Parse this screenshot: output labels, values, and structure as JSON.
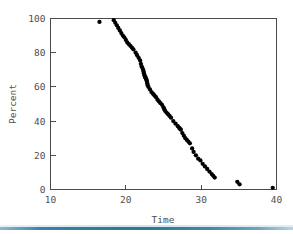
{
  "chart_data": {
    "type": "scatter",
    "title": "",
    "xlabel": "Time",
    "ylabel": "Percent",
    "xlim": [
      10,
      40
    ],
    "ylim": [
      0,
      100
    ],
    "xticks": [
      10,
      20,
      30,
      40
    ],
    "yticks": [
      0,
      20,
      40,
      60,
      80,
      100
    ],
    "xtick_labels": [
      "10",
      "20",
      "30",
      "40"
    ],
    "ytick_labels": [
      "0",
      "20",
      "40",
      "60",
      "80",
      "100"
    ],
    "grid": false,
    "legend": null,
    "marker": "filled-circle",
    "marker_color": "#000000",
    "series": [
      {
        "name": "Percent exceeding time",
        "x": [
          16.5,
          18.4,
          18.6,
          18.8,
          19.0,
          19.2,
          19.4,
          19.6,
          19.8,
          20.0,
          20.2,
          20.4,
          20.6,
          20.8,
          21.0,
          21.3,
          21.5,
          21.7,
          21.9,
          22.0,
          22.1,
          22.2,
          22.3,
          22.35,
          22.4,
          22.45,
          22.5,
          22.55,
          22.6,
          22.65,
          22.7,
          22.75,
          22.8,
          22.85,
          22.9,
          23.0,
          23.2,
          23.4,
          23.6,
          23.8,
          24.0,
          24.2,
          24.4,
          24.6,
          24.8,
          25.0,
          25.1,
          25.2,
          25.4,
          25.6,
          25.8,
          26.0,
          26.3,
          26.6,
          26.9,
          27.1,
          27.2,
          27.3,
          27.5,
          27.7,
          27.9,
          28.1,
          28.3,
          28.5,
          28.8,
          29.0,
          29.3,
          29.6,
          29.9,
          30.2,
          30.5,
          30.8,
          31.1,
          31.4,
          31.6,
          31.8,
          34.8,
          35.1,
          39.5
        ],
        "y": [
          98.0,
          99.0,
          97.5,
          96.0,
          94.5,
          93.0,
          91.5,
          90.0,
          89.0,
          87.5,
          86.0,
          85.0,
          84.0,
          83.0,
          82.0,
          80.0,
          78.5,
          77.0,
          75.5,
          73.5,
          72.0,
          71.0,
          70.0,
          69.0,
          68.0,
          67.0,
          66.5,
          66.0,
          65.5,
          65.0,
          64.5,
          64.0,
          63.0,
          62.0,
          61.0,
          60.0,
          58.5,
          57.0,
          56.0,
          55.0,
          54.0,
          52.5,
          51.5,
          50.5,
          49.5,
          48.0,
          47.0,
          46.0,
          45.0,
          44.0,
          43.0,
          42.0,
          40.0,
          38.5,
          37.0,
          36.0,
          35.5,
          35.0,
          33.0,
          31.5,
          30.0,
          29.0,
          28.0,
          27.0,
          24.0,
          22.0,
          20.0,
          18.0,
          17.0,
          15.0,
          13.5,
          12.0,
          10.5,
          9.0,
          8.0,
          7.0,
          4.5,
          3.0,
          1.0
        ]
      }
    ]
  },
  "decoration": {
    "bottom_rule_colors": [
      "#8fb8cf",
      "#2d7e94",
      "#bcd4e2"
    ]
  }
}
